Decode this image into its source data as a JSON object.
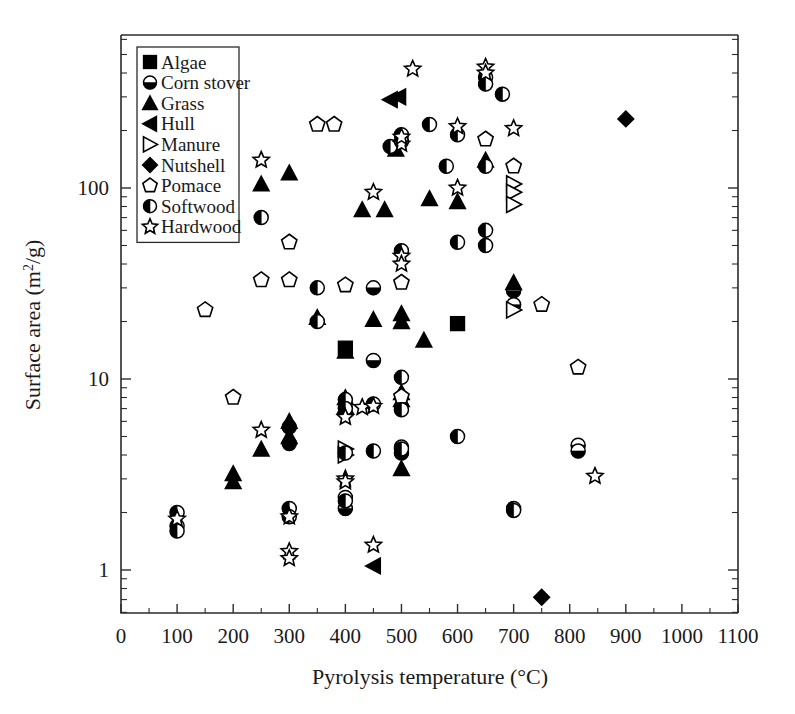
{
  "chart_data": {
    "type": "scatter",
    "title": "",
    "xlabel": "Pyrolysis temperature (°C)",
    "ylabel": "Surface area (m²/g)",
    "xlim": [
      0,
      1100
    ],
    "ylim": [
      0.6,
      600
    ],
    "yscale": "log",
    "xscale": "linear",
    "xticks": [
      0,
      100,
      200,
      300,
      400,
      500,
      600,
      700,
      800,
      900,
      1000,
      1100
    ],
    "xtick_labels": [
      "0",
      "100",
      "200",
      "300",
      "400",
      "500",
      "600",
      "700",
      "800",
      "900",
      "1000",
      "1100"
    ],
    "yticks": [
      1,
      10,
      100
    ],
    "ytick_labels": [
      "1",
      "10",
      "100"
    ],
    "grid": false,
    "legend_position": "upper-left-inside",
    "series": [
      {
        "name": "Algae",
        "marker": "filled-square",
        "points": [
          [
            400,
            14.5
          ],
          [
            600,
            19.5
          ]
        ]
      },
      {
        "name": "Corn stover",
        "marker": "half-circle-bottom",
        "points": [
          [
            300,
            5.6
          ],
          [
            300,
            4.6
          ],
          [
            400,
            2.4
          ],
          [
            400,
            2.1
          ],
          [
            450,
            30.0
          ],
          [
            450,
            12.5
          ],
          [
            500,
            4.4
          ],
          [
            500,
            4.1
          ],
          [
            700,
            29.0
          ],
          [
            700,
            24.5
          ],
          [
            815,
            4.5
          ],
          [
            815,
            4.2
          ]
        ]
      },
      {
        "name": "Grass",
        "marker": "filled-triangle-up",
        "points": [
          [
            200,
            3.2
          ],
          [
            200,
            2.9
          ],
          [
            250,
            4.3
          ],
          [
            300,
            6.0
          ],
          [
            300,
            5.0
          ],
          [
            300,
            120.0
          ],
          [
            250,
            105.0
          ],
          [
            350,
            21.0
          ],
          [
            400,
            14.0
          ],
          [
            400,
            8.0
          ],
          [
            400,
            7.2
          ],
          [
            430,
            77.0
          ],
          [
            450,
            20.5
          ],
          [
            470,
            77.0
          ],
          [
            490,
            160.0
          ],
          [
            500,
            22.0
          ],
          [
            500,
            20.0
          ],
          [
            500,
            8.5
          ],
          [
            500,
            7.8
          ],
          [
            500,
            3.4
          ],
          [
            540,
            16.0
          ],
          [
            550,
            88.0
          ],
          [
            600,
            85.0
          ],
          [
            650,
            140.0
          ],
          [
            700,
            32.0
          ]
        ]
      },
      {
        "name": "Hull",
        "marker": "filled-triangle-left",
        "points": [
          [
            450,
            1.05
          ],
          [
            480,
            290.0
          ],
          [
            495,
            300.0
          ]
        ]
      },
      {
        "name": "Manure",
        "marker": "open-triangle-right",
        "points": [
          [
            400,
            4.3
          ],
          [
            400,
            4.0
          ],
          [
            700,
            105.0
          ],
          [
            700,
            95.0
          ],
          [
            700,
            82.0
          ],
          [
            700,
            23.0
          ]
        ]
      },
      {
        "name": "Nutshell",
        "marker": "filled-diamond",
        "points": [
          [
            750,
            0.72
          ],
          [
            900,
            230.0
          ]
        ]
      },
      {
        "name": "Pomace",
        "marker": "open-pentagon",
        "points": [
          [
            150,
            23.0
          ],
          [
            200,
            8.0
          ],
          [
            250,
            33.0
          ],
          [
            300,
            33.0
          ],
          [
            300,
            52.0
          ],
          [
            350,
            215.0
          ],
          [
            380,
            215.0
          ],
          [
            400,
            31.0
          ],
          [
            500,
            8.1
          ],
          [
            500,
            32.0
          ],
          [
            650,
            180.0
          ],
          [
            700,
            130.0
          ],
          [
            750,
            24.5
          ],
          [
            815,
            11.5
          ]
        ]
      },
      {
        "name": "Softwood",
        "marker": "half-circle-left",
        "points": [
          [
            100,
            2.0
          ],
          [
            100,
            1.7
          ],
          [
            100,
            1.6
          ],
          [
            250,
            70.0
          ],
          [
            300,
            2.1
          ],
          [
            300,
            1.9
          ],
          [
            350,
            30.0
          ],
          [
            350,
            20.0
          ],
          [
            400,
            7.8
          ],
          [
            400,
            7.0
          ],
          [
            400,
            4.1
          ],
          [
            400,
            2.3
          ],
          [
            450,
            7.4
          ],
          [
            450,
            4.2
          ],
          [
            480,
            165.0
          ],
          [
            500,
            190.0
          ],
          [
            500,
            175.0
          ],
          [
            500,
            47.0
          ],
          [
            500,
            10.2
          ],
          [
            500,
            6.9
          ],
          [
            500,
            4.3
          ],
          [
            550,
            215.0
          ],
          [
            580,
            130.0
          ],
          [
            600,
            190.0
          ],
          [
            600,
            52.0
          ],
          [
            600,
            5.0
          ],
          [
            650,
            380.0
          ],
          [
            650,
            350.0
          ],
          [
            650,
            130.0
          ],
          [
            650,
            60.0
          ],
          [
            650,
            50.0
          ],
          [
            680,
            310.0
          ],
          [
            700,
            2.1
          ],
          [
            700,
            2.05
          ]
        ]
      },
      {
        "name": "Hardwood",
        "marker": "open-star",
        "points": [
          [
            100,
            1.85
          ],
          [
            250,
            5.4
          ],
          [
            250,
            140.0
          ],
          [
            300,
            1.25
          ],
          [
            300,
            1.15
          ],
          [
            300,
            1.9
          ],
          [
            400,
            6.3
          ],
          [
            400,
            3.0
          ],
          [
            400,
            2.9
          ],
          [
            430,
            7.1
          ],
          [
            450,
            7.2
          ],
          [
            450,
            1.35
          ],
          [
            450,
            95.0
          ],
          [
            500,
            170.0
          ],
          [
            500,
            185.0
          ],
          [
            500,
            44.0
          ],
          [
            500,
            40.0
          ],
          [
            520,
            420.0
          ],
          [
            600,
            100.0
          ],
          [
            600,
            210.0
          ],
          [
            650,
            430.0
          ],
          [
            650,
            400.0
          ],
          [
            700,
            205.0
          ],
          [
            845,
            3.1
          ]
        ]
      }
    ]
  },
  "legend": {
    "entries": [
      {
        "label": "Algae",
        "marker": "filled-square"
      },
      {
        "label": "Corn stover",
        "marker": "half-circle-bottom"
      },
      {
        "label": "Grass",
        "marker": "filled-triangle-up"
      },
      {
        "label": "Hull",
        "marker": "filled-triangle-left"
      },
      {
        "label": "Manure",
        "marker": "open-triangle-right"
      },
      {
        "label": "Nutshell",
        "marker": "filled-diamond"
      },
      {
        "label": "Pomace",
        "marker": "open-pentagon"
      },
      {
        "label": "Softwood",
        "marker": "half-circle-left"
      },
      {
        "label": "Hardwood",
        "marker": "open-star"
      }
    ]
  },
  "colors": {
    "marker": "#000000",
    "axis": "#2b2b2b",
    "background": "#ffffff"
  }
}
